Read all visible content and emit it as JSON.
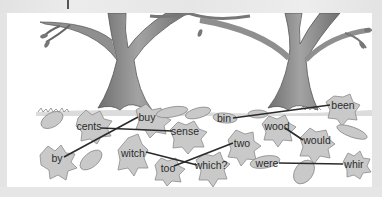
{
  "activity": {
    "type": "homophone-matching",
    "instruction_visible": false
  },
  "colors": {
    "leaf_fill": "#c9c9c9",
    "leaf_stroke": "#8c8c8c",
    "line": "#2a2a2a",
    "trunk": "#8f8f8f",
    "panel_bg": "#ffffff",
    "frame_bg": "#e4e4e4"
  },
  "words": [
    {
      "id": "buy",
      "label": "buy",
      "x": 147,
      "y": 117
    },
    {
      "id": "cents",
      "label": "cents",
      "x": 89,
      "y": 126
    },
    {
      "id": "sense",
      "label": "sense",
      "x": 185,
      "y": 131
    },
    {
      "id": "by",
      "label": "by",
      "x": 57,
      "y": 158
    },
    {
      "id": "witch",
      "label": "witch",
      "x": 133,
      "y": 153
    },
    {
      "id": "too",
      "label": "too",
      "x": 168,
      "y": 168
    },
    {
      "id": "which",
      "label": "which?",
      "x": 211,
      "y": 165
    },
    {
      "id": "two",
      "label": "two",
      "x": 242,
      "y": 143
    },
    {
      "id": "bin",
      "label": "bin",
      "x": 224,
      "y": 118
    },
    {
      "id": "been",
      "label": "been",
      "x": 343,
      "y": 105
    },
    {
      "id": "wood",
      "label": "wood",
      "x": 277,
      "y": 126
    },
    {
      "id": "would",
      "label": "would",
      "x": 317,
      "y": 140
    },
    {
      "id": "were",
      "label": "were",
      "x": 267,
      "y": 163
    },
    {
      "id": "whir",
      "label": "whir",
      "x": 354,
      "y": 164
    }
  ],
  "matches": [
    {
      "from": "buy",
      "to": "by"
    },
    {
      "from": "cents",
      "to": "sense"
    },
    {
      "from": "witch",
      "to": "which"
    },
    {
      "from": "too",
      "to": "two"
    },
    {
      "from": "bin",
      "to": "been"
    },
    {
      "from": "wood",
      "to": "would"
    },
    {
      "from": "were",
      "to": "whir"
    }
  ]
}
